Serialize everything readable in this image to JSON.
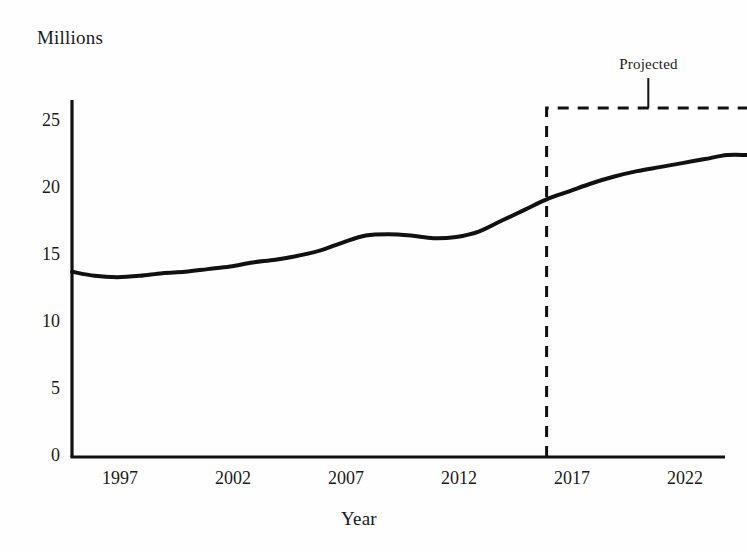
{
  "chart_data": {
    "type": "line",
    "title": "",
    "ylabel": "Millions",
    "xlabel": "Year",
    "ylim": [
      0,
      27
    ],
    "xlim": [
      1995,
      2026
    ],
    "grid": false,
    "legend": null,
    "ytick_labels": [
      "0",
      "5",
      "10",
      "15",
      "20",
      "25"
    ],
    "ytick_values": [
      0,
      5,
      10,
      15,
      20,
      25
    ],
    "xtick_labels": [
      "1997",
      "2002",
      "2007",
      "2012",
      "2017",
      "2022"
    ],
    "xtick_values": [
      1997,
      2002,
      2007,
      2012,
      2017,
      2022
    ],
    "x": [
      1995,
      1996,
      1997,
      1998,
      1999,
      2000,
      2001,
      2002,
      2003,
      2004,
      2005,
      2006,
      2007,
      2008,
      2009,
      2010,
      2011,
      2012,
      2013,
      2014,
      2015,
      2016,
      2017,
      2018,
      2019,
      2020,
      2021,
      2022,
      2023,
      2024,
      2025,
      2026
    ],
    "values": [
      13.8,
      13.5,
      13.4,
      13.5,
      13.7,
      13.8,
      14.0,
      14.2,
      14.5,
      14.7,
      15.0,
      15.4,
      16.0,
      16.5,
      16.6,
      16.5,
      16.3,
      16.4,
      16.8,
      17.6,
      18.4,
      19.2,
      19.8,
      20.4,
      20.9,
      21.3,
      21.6,
      21.9,
      22.2,
      22.5,
      22.5,
      22.5
    ],
    "annotations": [
      {
        "text": "Projected",
        "type": "dashed-box",
        "x_start": 2016,
        "x_end": 2025,
        "y_top": 26,
        "y_bottom": 0
      }
    ],
    "colors": {
      "line": "#111111",
      "axis": "#111111",
      "annotation": "#111111",
      "background": "#fefefe"
    }
  }
}
